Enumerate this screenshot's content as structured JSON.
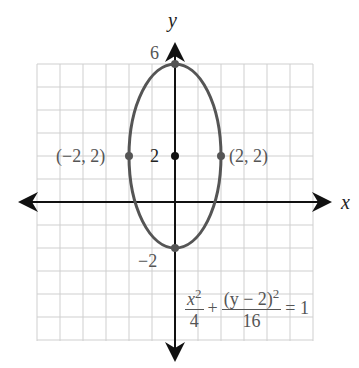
{
  "figure": {
    "axis_labels": {
      "x": "x",
      "y": "y"
    },
    "tick_labels": {
      "top": "6",
      "center_y": "2",
      "bottom": "−2"
    },
    "points": [
      {
        "label": "(−2, 2)",
        "x": -2,
        "y": 2
      },
      {
        "label": "(2, 2)",
        "x": 2,
        "y": 2
      },
      {
        "label": "center",
        "x": 0,
        "y": 2
      },
      {
        "label": "top vertex",
        "x": 0,
        "y": 6
      },
      {
        "label": "bottom vertex",
        "x": 0,
        "y": -2
      }
    ],
    "equation": {
      "term1_num": "x",
      "term1_num_exp": "2",
      "term1_den": "4",
      "plus": "+",
      "term2_num": "(y − 2)",
      "term2_num_exp": "2",
      "term2_den": "16",
      "equals": "= 1"
    },
    "colors": {
      "curve": "#555555",
      "axis": "#111111",
      "grid": "#c8c8c8"
    }
  },
  "labels": {
    "left_point": "(−2, 2)",
    "right_point": "(2, 2)"
  }
}
